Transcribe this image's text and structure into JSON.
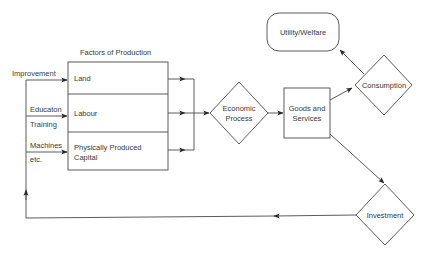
{
  "diagram": {
    "factors_title": "Factors of Production",
    "factors": [
      {
        "label": "Land"
      },
      {
        "label": "Labour"
      },
      {
        "label": "Physically Produced",
        "label2": "Capital"
      }
    ],
    "inputs": {
      "improvement": "Improvement",
      "education": "Educaton",
      "training": "Training",
      "machines": "Machines",
      "etc": "etc."
    },
    "economic_process": {
      "line1": "Economic",
      "line2": "Process"
    },
    "goods_services": {
      "line1": "Goods and",
      "line2": "Services"
    },
    "consumption": "Consumption",
    "utility_welfare": "Utility/Welfare",
    "investment": "Investment"
  }
}
